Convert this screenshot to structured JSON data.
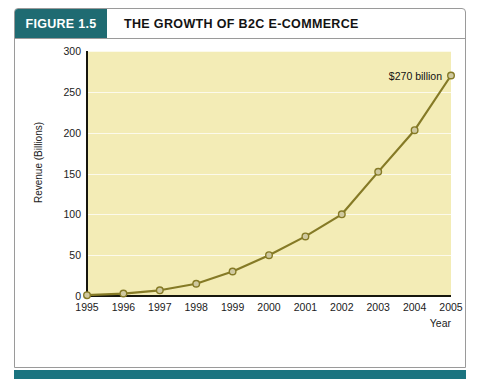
{
  "figure": {
    "badge_label": "FIGURE 1.5",
    "title": "THE GROWTH OF B2C E-COMMERCE",
    "caption": ""
  },
  "colors": {
    "badge_background": "#1f6b72",
    "footer_rule": "#1b7480",
    "plot_background": "#f3ecb6",
    "series_line": "#857a26",
    "marker_fill": "#cfc9a0",
    "axis": "#16160d",
    "panel_border": "#9a9a9a"
  },
  "chart_data": {
    "type": "line",
    "title": "THE GROWTH OF B2C E-COMMERCE",
    "xlabel": "Year",
    "ylabel": "Revenue (Billions)",
    "categories": [
      "1995",
      "1996",
      "1997",
      "1998",
      "1999",
      "2000",
      "2001",
      "2002",
      "2003",
      "2004",
      "2005"
    ],
    "values": [
      1,
      3,
      7,
      15,
      30,
      50,
      73,
      100,
      152,
      203,
      270
    ],
    "xlim": [
      "1995",
      "2005"
    ],
    "ylim": [
      0,
      300
    ],
    "yticks": [
      0,
      50,
      100,
      150,
      200,
      250,
      300
    ],
    "grid": true,
    "legend": "none",
    "annotations": [
      {
        "label": "$270 billion",
        "x": "2005",
        "y": 270
      }
    ]
  }
}
